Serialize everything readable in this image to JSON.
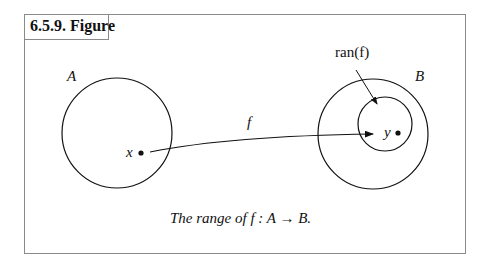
{
  "header": {
    "label": "6.5.9. Figure"
  },
  "figure": {
    "set_a_label": "A",
    "set_b_label": "B",
    "point_x_label": "x",
    "point_y_label": "y",
    "arrow_label": "f",
    "range_label": "ran(f)",
    "caption": "The range of f : A → B."
  }
}
